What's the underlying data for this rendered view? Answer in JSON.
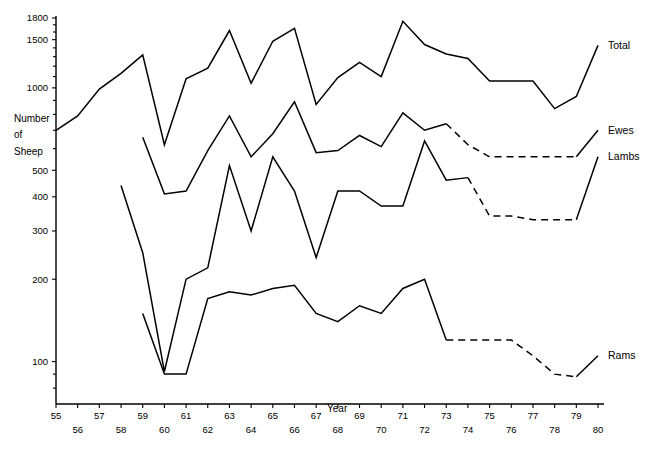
{
  "chart_data": {
    "type": "line",
    "title": "",
    "xlabel": "Year",
    "ylabel": "Number of Sheep",
    "ylabel_lines": [
      "Number",
      "of",
      "Sheep"
    ],
    "yscale": "log",
    "ylim": [
      70,
      1800
    ],
    "xlim": [
      55,
      80
    ],
    "grid": false,
    "legend_position": "right-inline",
    "ytick_labels": [
      "1800",
      "1500",
      "1000",
      "500",
      "400",
      "300",
      "200",
      "100"
    ],
    "ytick_values": [
      1800,
      1500,
      1000,
      500,
      400,
      300,
      200,
      100
    ],
    "yminor_values": [
      1700,
      1600,
      1400,
      1300,
      1200,
      1100,
      900,
      800,
      700,
      600,
      90,
      80
    ],
    "xtick_labels": [
      "55",
      "56",
      "57",
      "58",
      "59",
      "60",
      "61",
      "62",
      "63",
      "64",
      "65",
      "66",
      "67",
      "68",
      "69",
      "70",
      "71",
      "72",
      "73",
      "74",
      "75",
      "76",
      "77",
      "78",
      "79",
      "80"
    ],
    "x": [
      55,
      56,
      57,
      58,
      59,
      60,
      61,
      62,
      63,
      64,
      65,
      66,
      67,
      68,
      69,
      70,
      71,
      72,
      73,
      74,
      75,
      76,
      77,
      78,
      79,
      80
    ],
    "series": [
      {
        "name": "Total",
        "label": "Total",
        "style": "solid",
        "x": [
          55,
          56,
          57,
          58,
          59,
          60,
          61,
          62,
          63,
          64,
          65,
          66,
          67,
          68,
          69,
          70,
          71,
          72,
          73,
          74,
          75,
          76,
          77,
          78,
          79,
          80
        ],
        "values": [
          700,
          790,
          990,
          1130,
          1320,
          620,
          1080,
          1180,
          1620,
          1040,
          1480,
          1650,
          870,
          1090,
          1240,
          1100,
          1750,
          1440,
          1330,
          1280,
          1060,
          1060,
          1060,
          840,
          930,
          1430
        ]
      },
      {
        "name": "Ewes",
        "label": "Ewes",
        "style": "solid-then-dashed",
        "dash_from": 73,
        "x": [
          59,
          60,
          61,
          62,
          63,
          64,
          65,
          66,
          67,
          68,
          69,
          70,
          71,
          72,
          73,
          74,
          75,
          76,
          77,
          78,
          79,
          80
        ],
        "values": [
          660,
          410,
          420,
          590,
          790,
          560,
          680,
          890,
          580,
          590,
          670,
          610,
          810,
          700,
          740,
          620,
          560,
          560,
          560,
          560,
          560,
          700
        ]
      },
      {
        "name": "Lambs",
        "label": "Lambs",
        "style": "solid-then-dashed",
        "dash_from": 74,
        "x": [
          58,
          59,
          60,
          61,
          62,
          63,
          64,
          65,
          66,
          67,
          68,
          69,
          70,
          71,
          72,
          73,
          74,
          75,
          76,
          77,
          78,
          79,
          80
        ],
        "values": [
          440,
          250,
          92,
          200,
          220,
          520,
          300,
          560,
          420,
          240,
          420,
          420,
          370,
          370,
          640,
          460,
          470,
          340,
          340,
          330,
          330,
          330,
          560
        ]
      },
      {
        "name": "Rams",
        "label": "Rams",
        "style": "solid-then-dashed",
        "dash_from": 73,
        "x": [
          59,
          60,
          61,
          62,
          63,
          64,
          65,
          66,
          67,
          68,
          69,
          70,
          71,
          72,
          73,
          74,
          75,
          76,
          77,
          78,
          79,
          80
        ],
        "values": [
          150,
          90,
          90,
          170,
          180,
          175,
          185,
          190,
          150,
          140,
          160,
          150,
          185,
          200,
          120,
          120,
          120,
          120,
          105,
          90,
          88,
          105
        ]
      }
    ]
  },
  "series_labels": {
    "total": "Total",
    "ewes": "Ewes",
    "lambs": "Lambs",
    "rams": "Rams"
  },
  "axis": {
    "x_title": "Year",
    "y_title_line1": "Number",
    "y_title_line2": "of",
    "y_title_line3": "Sheep"
  },
  "colors": {
    "ink": "#000000",
    "paper": "#ffffff"
  }
}
